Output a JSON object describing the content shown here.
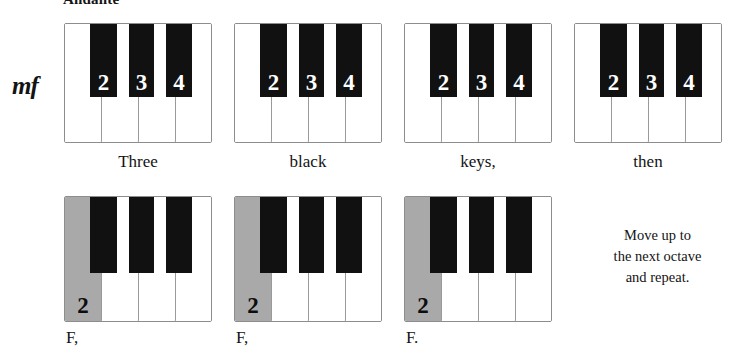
{
  "score": {
    "tempo_marking": "Andante",
    "dynamic_marking": "mf",
    "instruction_note": {
      "line1": "Move up to",
      "line2": "the next octave",
      "line3": "and repeat."
    }
  },
  "keyboards": {
    "top_row": [
      {
        "id": "keyboard-1",
        "caption": "Three",
        "white_keys": [
          {
            "label": "",
            "shaded": false
          },
          {
            "label": "",
            "shaded": false
          },
          {
            "label": "",
            "shaded": false
          },
          {
            "label": "",
            "shaded": false
          }
        ],
        "black_keys": [
          {
            "label": "2"
          },
          {
            "label": "3"
          },
          {
            "label": "4"
          }
        ]
      },
      {
        "id": "keyboard-2",
        "caption": "black",
        "white_keys": [
          {
            "label": "",
            "shaded": false
          },
          {
            "label": "",
            "shaded": false
          },
          {
            "label": "",
            "shaded": false
          },
          {
            "label": "",
            "shaded": false
          }
        ],
        "black_keys": [
          {
            "label": "2"
          },
          {
            "label": "3"
          },
          {
            "label": "4"
          }
        ]
      },
      {
        "id": "keyboard-3",
        "caption": "keys,",
        "white_keys": [
          {
            "label": "",
            "shaded": false
          },
          {
            "label": "",
            "shaded": false
          },
          {
            "label": "",
            "shaded": false
          },
          {
            "label": "",
            "shaded": false
          }
        ],
        "black_keys": [
          {
            "label": "2"
          },
          {
            "label": "3"
          },
          {
            "label": "4"
          }
        ]
      },
      {
        "id": "keyboard-4",
        "caption": "then",
        "white_keys": [
          {
            "label": "",
            "shaded": false
          },
          {
            "label": "",
            "shaded": false
          },
          {
            "label": "",
            "shaded": false
          },
          {
            "label": "",
            "shaded": false
          }
        ],
        "black_keys": [
          {
            "label": "2"
          },
          {
            "label": "3"
          },
          {
            "label": "4"
          }
        ]
      }
    ],
    "bottom_row": [
      {
        "id": "keyboard-5",
        "caption": "F,",
        "white_keys": [
          {
            "label": "2",
            "shaded": true
          },
          {
            "label": "",
            "shaded": false
          },
          {
            "label": "",
            "shaded": false
          },
          {
            "label": "",
            "shaded": false
          }
        ],
        "black_keys": [
          {
            "label": ""
          },
          {
            "label": ""
          },
          {
            "label": ""
          }
        ]
      },
      {
        "id": "keyboard-6",
        "caption": "F,",
        "white_keys": [
          {
            "label": "2",
            "shaded": true
          },
          {
            "label": "",
            "shaded": false
          },
          {
            "label": "",
            "shaded": false
          },
          {
            "label": "",
            "shaded": false
          }
        ],
        "black_keys": [
          {
            "label": ""
          },
          {
            "label": ""
          },
          {
            "label": ""
          }
        ]
      },
      {
        "id": "keyboard-7",
        "caption": "F.",
        "white_keys": [
          {
            "label": "2",
            "shaded": true
          },
          {
            "label": "",
            "shaded": false
          },
          {
            "label": "",
            "shaded": false
          },
          {
            "label": "",
            "shaded": false
          }
        ],
        "black_keys": [
          {
            "label": ""
          },
          {
            "label": ""
          },
          {
            "label": ""
          }
        ]
      }
    ]
  },
  "colors": {
    "black_key": "#111111",
    "white_key": "#ffffff",
    "shaded_key": "#a9a9a9",
    "outline": "#8d8d8d",
    "text": "#131313"
  }
}
